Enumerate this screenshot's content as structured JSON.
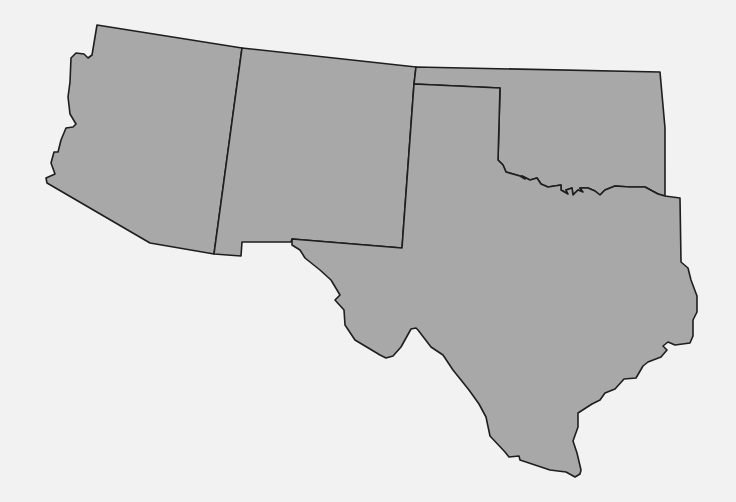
{
  "map": {
    "title": "",
    "region": "Southwestern United States",
    "colors": {
      "background": "#f2f2f2",
      "state_fill": "#a8a8a8",
      "border": "#1e1e1e"
    },
    "states": [
      {
        "id": "arizona",
        "label": ""
      },
      {
        "id": "new-mexico",
        "label": ""
      },
      {
        "id": "oklahoma",
        "label": ""
      },
      {
        "id": "texas",
        "label": ""
      }
    ]
  }
}
